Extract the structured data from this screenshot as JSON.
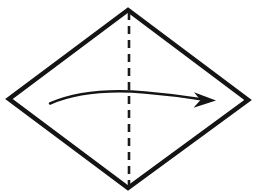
{
  "canvas": {
    "width": 255,
    "height": 196,
    "background_color": "#FFFFFF"
  },
  "diagram": {
    "ink_color": "#141414",
    "shape": {
      "name": "rhombus",
      "icon": "diamond-outline-icon",
      "fill_color": "#FFFFFF",
      "stroke_color": "#141414",
      "stroke_width": 4.6,
      "vertices": {
        "top": [
          128,
          10
        ],
        "right": [
          248,
          100
        ],
        "bottom": [
          128,
          188
        ],
        "left": [
          9,
          99
        ]
      },
      "points_path": "128,10 248,100 128,188 9,99"
    },
    "fold_line": {
      "name": "vertical-fold-crease",
      "icon": "dashed-line-icon",
      "style": "dashed",
      "orientation": "vertical",
      "stroke_color": "#1A1A1A",
      "stroke_width": 2.6,
      "dash_length": 8,
      "gap_length": 6,
      "dash_array": "8 6",
      "x": 129,
      "y_start": 12,
      "y_end": 186,
      "path": "M 129 12 L 129 186"
    },
    "motion_arrow": {
      "name": "fold-direction-arrow",
      "icon": "curved-arrow-right-icon",
      "direction": "left-to-right",
      "stroke_color": "#141414",
      "curve_path": "M 50 103.5 C 80 90.5, 118 90.2, 145 92.4 C 170 94.4, 190 97.4, 203 99.6",
      "stroke_width_start": 1.2,
      "stroke_width_end": 3.4,
      "tail": [
        50,
        103.5
      ],
      "apex": [
        132,
        91.5
      ],
      "tip": [
        216,
        100.5
      ],
      "head_path": "M 216 100.5 L 194 92.2 L 200.5 100.0 L 193.5 107.8 Z"
    }
  }
}
